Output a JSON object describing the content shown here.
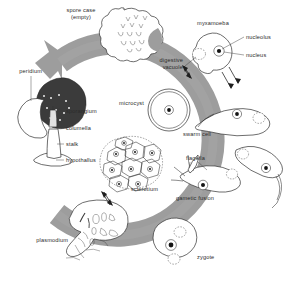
{
  "figure": {
    "background_color": "#ffffff",
    "ring_color": "#9d9d9d",
    "ink_color": "#2f2f2f",
    "width": 284,
    "height": 287
  },
  "labels": {
    "spore_case_line1": "spore case",
    "spore_case_line2": "(empty)",
    "myxamoeba": "myxamoeba",
    "nucleolus": "nucleolus",
    "nucleus": "nucleus",
    "digestive_line1": "digestive",
    "digestive_line2": "vacuole",
    "swarm_cell": "swarm cell",
    "microcyst": "microcyst",
    "flagella": "flagella",
    "gametic_fusion": "gametic fusion",
    "zygote": "zygote",
    "sclerotium": "sclerotium",
    "plasmodium": "plasmodium",
    "peridium": "peridium",
    "sporangium": "sporangium",
    "columella": "columella",
    "stalk": "stalk",
    "hypothallus": "hypothallus"
  },
  "stages": [
    {
      "name": "spore case (empty)",
      "position": "top"
    },
    {
      "name": "myxamoeba",
      "position": "top-right"
    },
    {
      "name": "swarm cell",
      "position": "right"
    },
    {
      "name": "gametic fusion",
      "position": "lower-right"
    },
    {
      "name": "zygote",
      "position": "bottom-right"
    },
    {
      "name": "plasmodium",
      "position": "bottom-left"
    },
    {
      "name": "sporangium",
      "position": "left"
    }
  ],
  "side_branches": [
    {
      "name": "microcyst",
      "from": "myxamoeba",
      "reversible": true
    },
    {
      "name": "sclerotium",
      "from": "plasmodium",
      "reversible": true
    }
  ],
  "sporangium_parts": [
    "peridium",
    "sporangium",
    "columella",
    "stalk",
    "hypothallus"
  ],
  "cell_parts": [
    "nucleolus",
    "nucleus",
    "digestive vacuole",
    "flagella"
  ]
}
